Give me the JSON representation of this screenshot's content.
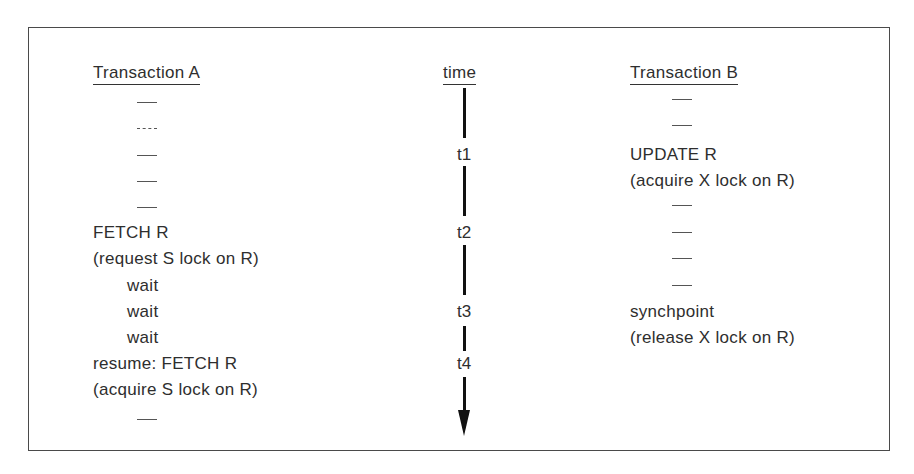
{
  "diagram": {
    "type": "transaction-timeline",
    "columns": {
      "transaction_a": {
        "header": "Transaction A",
        "rows": [
          {
            "kind": "dash"
          },
          {
            "kind": "dash"
          },
          {
            "kind": "dash"
          },
          {
            "kind": "dash"
          },
          {
            "kind": "dash"
          },
          {
            "kind": "text",
            "text": "FETCH R"
          },
          {
            "kind": "text",
            "text": "(request S lock on R)"
          },
          {
            "kind": "indent",
            "text": "wait"
          },
          {
            "kind": "indent",
            "text": "wait"
          },
          {
            "kind": "indent",
            "text": "wait"
          },
          {
            "kind": "text",
            "text": "resume: FETCH R"
          },
          {
            "kind": "text",
            "text": "(acquire S lock on R)"
          },
          {
            "kind": "dash"
          }
        ]
      },
      "time": {
        "header": "time",
        "labels": [
          "t1",
          "t2",
          "t3",
          "t4"
        ],
        "arrow_direction": "down"
      },
      "transaction_b": {
        "header": "Transaction B",
        "rows": [
          {
            "kind": "dash"
          },
          {
            "kind": "dash"
          },
          {
            "kind": "text",
            "text": "UPDATE R"
          },
          {
            "kind": "text",
            "text": "(acquire X lock on R)"
          },
          {
            "kind": "dash"
          },
          {
            "kind": "dash"
          },
          {
            "kind": "dash"
          },
          {
            "kind": "dash"
          },
          {
            "kind": "text",
            "text": "synchpoint"
          },
          {
            "kind": "text",
            "text": "(release X lock on R)"
          }
        ]
      }
    }
  }
}
